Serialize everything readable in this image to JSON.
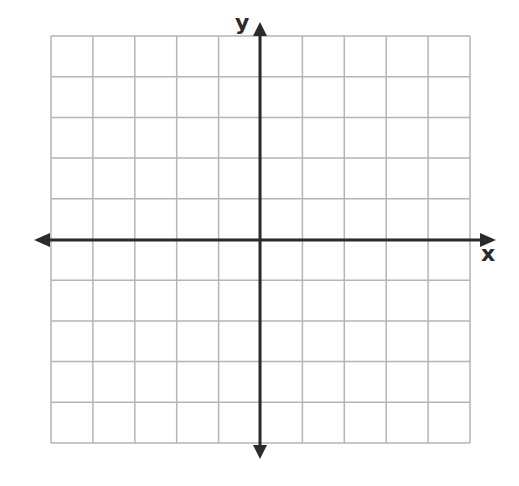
{
  "diagram": {
    "type": "coordinate-plane",
    "grid": {
      "columns": 10,
      "rows": 10,
      "left": 51,
      "top": 36,
      "right": 470,
      "bottom": 443,
      "line_color": "#b5b5b5"
    },
    "axes": {
      "color": "#2b2b2b",
      "origin_x": 260,
      "origin_y": 240,
      "x_label": "x",
      "y_label": "y"
    }
  }
}
